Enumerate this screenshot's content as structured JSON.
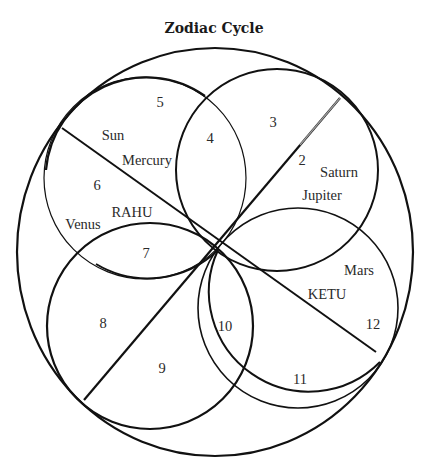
{
  "title": "Zodiac Cycle",
  "houses": {
    "h2": "2",
    "h3": "3",
    "h4": "4",
    "h5": "5",
    "h6": "6",
    "h7": "7",
    "h8": "8",
    "h9": "9",
    "h10": "10",
    "h11": "11",
    "h12": "12"
  },
  "planets": {
    "sun": "Sun",
    "mercury": "Mercury",
    "venus": "Venus",
    "saturn": "Saturn",
    "jupiter": "Jupiter",
    "mars": "Mars"
  },
  "nodes": {
    "rahu": "RAHU",
    "ketu": "KETU"
  },
  "colors": {
    "stroke": "#111111",
    "text": "#2a2a2a",
    "background": "#ffffff"
  }
}
